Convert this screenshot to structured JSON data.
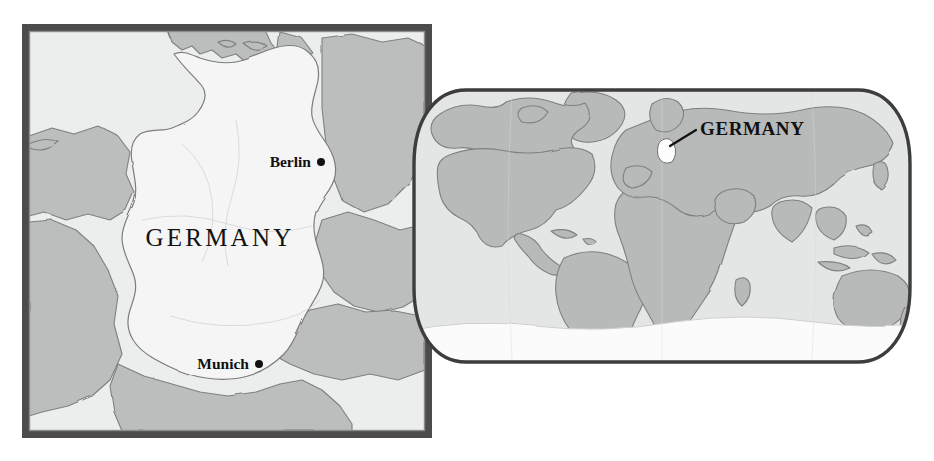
{
  "figure": {
    "type": "locator-map-pair",
    "subject": "Germany",
    "background_color": "#ffffff"
  },
  "detail_map": {
    "name": "Germany detail map",
    "country_label": "GERMANY",
    "frame": {
      "color": "#4a4a4a",
      "inner_color": "#6d6d6d",
      "thickness_px": 7
    },
    "colors": {
      "subject_fill": "#f4f4f4",
      "neighbor_fill": "#b9b9b9",
      "sea_fill": "#eceded",
      "border_line": "#7a7a7a",
      "coast_line": "#6f6f6f"
    },
    "cities": [
      {
        "name": "Berlin",
        "marker": "dot",
        "label_side": "left"
      },
      {
        "name": "Munich",
        "marker": "dot",
        "label_side": "left"
      }
    ]
  },
  "world_map": {
    "name": "World locator inset",
    "projection": "Robinson",
    "callout_label": "GERMANY",
    "colors": {
      "ocean_fill": "#e3e4e4",
      "land_fill": "#b7b8b8",
      "antarctica_fill": "#fbfbfb",
      "outline": "#3c3c3c",
      "land_line": "#7d7d7d",
      "highlight_fill": "#fdfdfd",
      "leader_line": "#111111"
    },
    "highlight": {
      "country": "Germany",
      "marker": "white-patch-with-leader-line"
    }
  }
}
